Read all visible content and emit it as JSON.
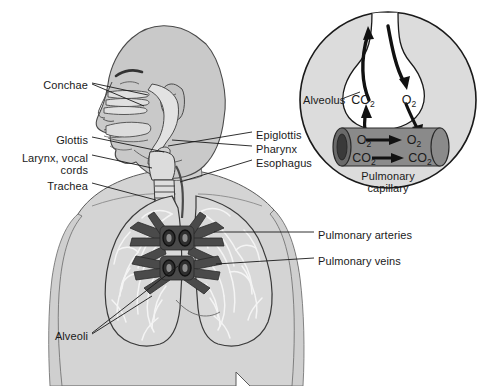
{
  "figure": {
    "background_color": "#ffffff",
    "line_color": "#1a1a1a"
  },
  "palette": {
    "body_fill": "#d4d4d4",
    "head_fill": "#c9c9c9",
    "lung_fill": "#d9d9d9",
    "lung_texture": "#f2f2f2",
    "vessel_fill": "#4a4a4a",
    "vessel_dark": "#333333",
    "airway_fill": "#e2e2e2",
    "inset_fill": "#dcdcdc",
    "alveolus_air": "#ffffff",
    "capillary_fill": "#8a8a8a",
    "capillary_end": "#4a4a4a",
    "outline": "#1a1a1a"
  },
  "labels_left": [
    {
      "id": "conchae",
      "text": "Conchae",
      "x": 88,
      "y": 85,
      "align": "right"
    },
    {
      "id": "glottis",
      "text": "Glottis",
      "x": 88,
      "y": 140,
      "align": "right"
    },
    {
      "id": "larynx",
      "text": "Larynx, vocal",
      "x": 88,
      "y": 158,
      "align": "right"
    },
    {
      "id": "cords",
      "text": "cords",
      "x": 88,
      "y": 170,
      "align": "right"
    },
    {
      "id": "trachea",
      "text": "Trachea",
      "x": 88,
      "y": 186,
      "align": "right"
    },
    {
      "id": "alveoli",
      "text": "Alveoli",
      "x": 88,
      "y": 336,
      "align": "right"
    }
  ],
  "labels_right": [
    {
      "id": "epiglottis",
      "text": "Epiglottis",
      "x": 256,
      "y": 135
    },
    {
      "id": "pharynx",
      "text": "Pharynx",
      "x": 256,
      "y": 149
    },
    {
      "id": "esophagus",
      "text": "Esophagus",
      "x": 256,
      "y": 163
    },
    {
      "id": "pulmonary-arteries",
      "text": "Pulmonary arteries",
      "x": 318,
      "y": 235
    },
    {
      "id": "pulmonary-veins",
      "text": "Pulmonary veins",
      "x": 318,
      "y": 261
    }
  ],
  "inset": {
    "alveolus_label": "Alveolus",
    "alveolus_label_x": 305,
    "alveolus_label_y": 100,
    "caption_line1": "Pulmonary",
    "caption_line2": "capillary",
    "caption_x": 388,
    "caption_y": 176,
    "air_space": {
      "co2_label": "CO",
      "co2_sub": "2",
      "o2_label": "O",
      "o2_sub": "2"
    },
    "capillary": {
      "o2_in_label": "O",
      "o2_in_sub": "2",
      "o2_out_label": "O",
      "o2_out_sub": "2",
      "co2_in_label": "CO",
      "co2_in_sub": "2",
      "co2_out_label": "CO",
      "co2_out_sub": "2"
    },
    "gas_flow": [
      {
        "gas": "CO2",
        "direction": "out of capillary into alveolus then out of body"
      },
      {
        "gas": "O2",
        "direction": "into alveolus then into capillary"
      }
    ]
  }
}
